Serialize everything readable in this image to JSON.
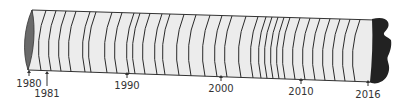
{
  "diagram": {
    "colors": {
      "core_fill": "#ececec",
      "ring_line": "#2a2a2a",
      "outline": "#333333",
      "cut_face": "#6a6a6a",
      "bark": "#222222",
      "label_text": "#333333"
    },
    "rings_x": [
      46,
      56,
      66,
      76,
      90,
      96,
      112,
      122,
      134,
      140,
      150,
      162,
      170,
      184,
      196,
      210,
      222,
      232,
      246,
      258,
      266,
      272,
      278,
      284,
      290,
      300,
      310,
      320,
      330,
      340,
      350,
      360
    ],
    "markers": [
      {
        "year": "1980",
        "x": 29,
        "arrow_top": 70,
        "arrow_bottom": 76,
        "label_y": 79
      },
      {
        "year": "1981",
        "x": 47,
        "arrow_top": 71,
        "arrow_bottom": 86,
        "label_y": 89
      },
      {
        "year": "1990",
        "x": 127,
        "arrow_top": 72,
        "arrow_bottom": 78,
        "label_y": 81
      },
      {
        "year": "2000",
        "x": 221,
        "arrow_top": 75,
        "arrow_bottom": 81,
        "label_y": 84
      },
      {
        "year": "2010",
        "x": 301,
        "arrow_top": 78,
        "arrow_bottom": 84,
        "label_y": 87
      },
      {
        "year": "2016",
        "x": 368,
        "arrow_top": 80,
        "arrow_bottom": 86,
        "label_y": 90
      }
    ]
  }
}
